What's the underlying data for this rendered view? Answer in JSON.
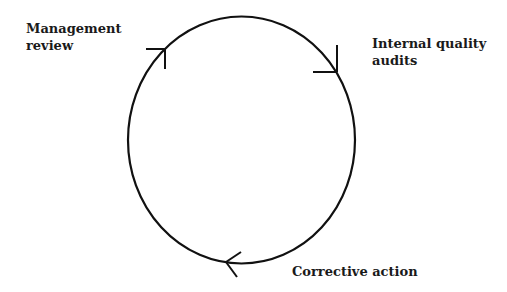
{
  "diagram": {
    "type": "cycle",
    "nodes": [
      {
        "id": "management_review",
        "lines": [
          "Management",
          "review"
        ]
      },
      {
        "id": "internal_quality_audits",
        "lines": [
          "Internal quality",
          "audits"
        ]
      },
      {
        "id": "corrective_action",
        "lines": [
          "Corrective action"
        ]
      }
    ],
    "direction": "clockwise",
    "colors": {
      "stroke": "#111111",
      "text": "#1a1a1a",
      "background": "#ffffff"
    }
  }
}
